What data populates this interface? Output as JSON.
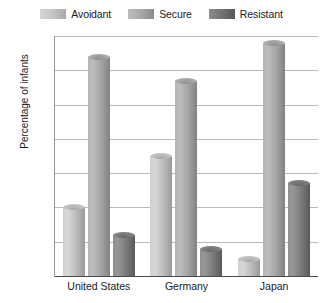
{
  "legend": {
    "items": [
      {
        "label": "Avoidant",
        "swatch": "legend-swatch-avoidant",
        "color": "#c6c6c6"
      },
      {
        "label": "Secure",
        "swatch": "legend-swatch-secure",
        "color": "#ababab"
      },
      {
        "label": "Resistant",
        "swatch": "legend-swatch-resistant",
        "color": "#757575"
      }
    ]
  },
  "axes": {
    "y_title": "Percentage of infants",
    "y_ticks": [
      "70",
      "60",
      "50",
      "40",
      "30",
      "20",
      "10",
      "0"
    ],
    "x_categories": [
      "United States",
      "Germany",
      "Japan"
    ]
  },
  "chart_data": {
    "type": "bar",
    "title": "",
    "xlabel": "",
    "ylabel": "Percentage of infants",
    "ylim": [
      0,
      70
    ],
    "ytick_step": 10,
    "grid": true,
    "legend_position": "top-center",
    "style": "3d-cylinder-grouped",
    "categories": [
      "United States",
      "Germany",
      "Japan"
    ],
    "series": [
      {
        "name": "Avoidant",
        "color": "#c6c6c6",
        "values": [
          20,
          35,
          5
        ]
      },
      {
        "name": "Secure",
        "color": "#ababab",
        "values": [
          64,
          57,
          68
        ]
      },
      {
        "name": "Resistant",
        "color": "#757575",
        "values": [
          12,
          8,
          27
        ]
      }
    ]
  }
}
